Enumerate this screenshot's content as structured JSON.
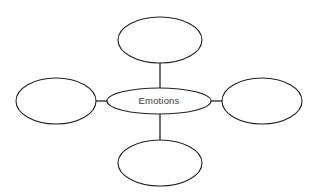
{
  "diagram": {
    "type": "spider-concept-map",
    "title": "",
    "background_color": "#ffffff",
    "stroke_color": "#231f20",
    "text_color": "#3a3a3c",
    "center_node": {
      "id": "center",
      "label": "Emotions",
      "shape": "ellipse",
      "cx": 159,
      "cy": 101,
      "rx": 52,
      "ry": 13
    },
    "branch_nodes": [
      {
        "id": "branch-top",
        "label": "",
        "shape": "ellipse",
        "position": "top",
        "cx": 160,
        "cy": 40,
        "rx": 42,
        "ry": 23
      },
      {
        "id": "branch-right",
        "label": "",
        "shape": "ellipse",
        "position": "right",
        "cx": 262,
        "cy": 101,
        "rx": 40,
        "ry": 23
      },
      {
        "id": "branch-bottom",
        "label": "",
        "shape": "ellipse",
        "position": "bottom",
        "cx": 160,
        "cy": 163,
        "rx": 42,
        "ry": 23
      },
      {
        "id": "branch-left",
        "label": "",
        "shape": "ellipse",
        "position": "left",
        "cx": 56,
        "cy": 101,
        "rx": 40,
        "ry": 23
      }
    ],
    "connectors": [
      {
        "id": "connector-top",
        "from": "center",
        "to": "branch-top",
        "x1": 160,
        "y1": 62,
        "x2": 160,
        "y2": 89
      },
      {
        "id": "connector-right",
        "from": "center",
        "to": "branch-right",
        "x1": 211,
        "y1": 101,
        "x2": 222,
        "y2": 101
      },
      {
        "id": "connector-bottom",
        "from": "center",
        "to": "branch-bottom",
        "x1": 160,
        "y1": 113,
        "x2": 160,
        "y2": 141
      },
      {
        "id": "connector-left",
        "from": "center",
        "to": "branch-left",
        "x1": 96,
        "y1": 101,
        "x2": 108,
        "y2": 101
      }
    ]
  }
}
